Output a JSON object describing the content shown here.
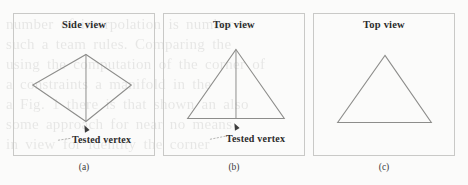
{
  "figure": {
    "background_color": "#fbfbfa",
    "stroke_color": "#8d8d8b",
    "text_color": "#2b2b2b",
    "panel_border_color": "#c9c9c7"
  },
  "ghost_text": [
    "number of interpolation is number to",
    "such a team rules. Comparing the",
    "using the computation of the corner of",
    "a constraints    a manifold in the",
    "a Fig. 1 there is that shown an also",
    "some approach for    near no means",
    "in view   for  identity the corner"
  ],
  "panels": [
    {
      "id": "a",
      "view_label": "Side view",
      "caption": "(a)",
      "shape": "diamond",
      "has_median": true,
      "has_tested_vertex": true,
      "tested_vertex_label": "Tested vertex"
    },
    {
      "id": "b",
      "view_label": "Top view",
      "caption": "(b)",
      "shape": "triangle",
      "has_median": true,
      "has_tested_vertex": true,
      "tested_vertex_label": "Tested vertex"
    },
    {
      "id": "c",
      "view_label": "Top view",
      "caption": "(c)",
      "shape": "triangle",
      "has_median": false,
      "has_tested_vertex": false,
      "tested_vertex_label": ""
    }
  ]
}
